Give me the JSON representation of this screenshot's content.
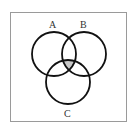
{
  "diagram": {
    "type": "venn",
    "sets": [
      {
        "label": "A",
        "cx": 54,
        "cy": 54,
        "r": 22
      },
      {
        "label": "B",
        "cx": 84,
        "cy": 54,
        "r": 22
      },
      {
        "label": "C",
        "cx": 68,
        "cy": 82,
        "r": 22
      }
    ],
    "shaded_region": "A ∩ B ∩ C",
    "shade_color": "#c8c8c8",
    "stroke_color": "#111111"
  }
}
